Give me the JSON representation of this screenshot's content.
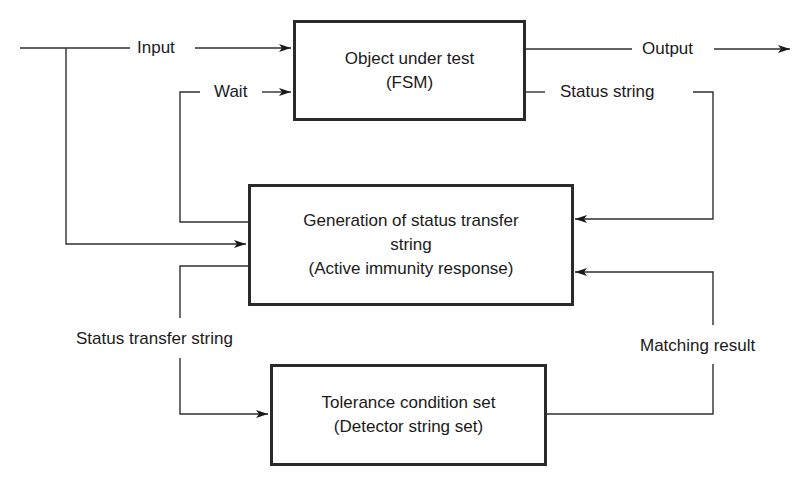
{
  "diagram": {
    "nodes": {
      "fsm": {
        "line1": "Object under test",
        "line2": "(FSM)"
      },
      "generator": {
        "line1": "Generation of status transfer",
        "line2": "string",
        "line3": "(Active immunity response)"
      },
      "tolerance": {
        "line1": "Tolerance condition set",
        "line2": "(Detector string set)"
      }
    },
    "edges": {
      "input": "Input",
      "wait": "Wait",
      "output": "Output",
      "status_string": "Status string",
      "status_transfer_string": "Status transfer string",
      "matching_result": "Matching result"
    },
    "connections": [
      {
        "from": "external-input",
        "to": "fsm",
        "label": "Input"
      },
      {
        "from": "external-input",
        "to": "generator",
        "label": "Input"
      },
      {
        "from": "generator",
        "to": "fsm",
        "label": "Wait"
      },
      {
        "from": "fsm",
        "to": "external-output",
        "label": "Output"
      },
      {
        "from": "fsm",
        "to": "generator",
        "label": "Status string"
      },
      {
        "from": "generator",
        "to": "tolerance",
        "label": "Status transfer string"
      },
      {
        "from": "tolerance",
        "to": "generator",
        "label": "Matching result"
      }
    ],
    "colors": {
      "line": "#2f2f2f",
      "box_border": "#2a2a2a",
      "background": "#ffffff"
    }
  }
}
